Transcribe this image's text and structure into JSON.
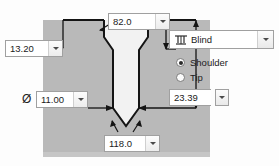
{
  "dialog": {
    "title": "Hole Feature Preview"
  },
  "fields": {
    "countersink_angle": {
      "value": "82.0",
      "name": "countersink-angle"
    },
    "countersink_depth": {
      "value": "13.20",
      "name": "countersink-depth"
    },
    "hole_diameter": {
      "value": "11.00",
      "symbol": "Ø",
      "name": "hole-diameter"
    },
    "hole_depth": {
      "value": "23.39",
      "name": "hole-depth"
    },
    "drill_point_angle": {
      "value": "118.0",
      "name": "drill-point-angle"
    }
  },
  "termination": {
    "label": "Blind",
    "icon": "blind-depth-icon"
  },
  "depth_reference": {
    "options": [
      {
        "label": "Shoulder",
        "selected": true
      },
      {
        "label": "Tip",
        "selected": false
      }
    ]
  },
  "colors": {
    "material": "#b9b9b9",
    "cavity": "#f2f2f2",
    "outline": "#1a1a1a",
    "field_border": "#a0a0a0"
  },
  "icons": {
    "caret": "chevron-down-icon",
    "diameter": "diameter-icon"
  }
}
